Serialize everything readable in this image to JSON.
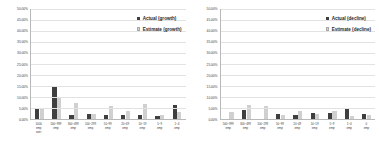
{
  "chart_data": [
    {
      "type": "bar",
      "title": "",
      "xlabel": "",
      "ylabel": "",
      "ylim": [
        0,
        50
      ],
      "grid": true,
      "legend_position": "top-right",
      "tick_labels": [
        "0.00%",
        "5.00%",
        "10.00%",
        "15.00%",
        "20.00%",
        "25.00%",
        "30.00%",
        "35.00%",
        "40.00%",
        "45.00%",
        "50.00%"
      ],
      "categories": [
        "1000\nemp\nover",
        "500~999\nemp",
        "300~499\nemp",
        "100~299\nemp",
        "50~99\nemp",
        "20~49\nemp",
        "10~19\nemp",
        "5~9\nemp",
        "1~4\nemp"
      ],
      "series": [
        {
          "name": "Actual (growth)",
          "values": [
            4.6,
            15.0,
            2.0,
            2.3,
            1.8,
            2.0,
            1.8,
            1.5,
            6.2
          ]
        },
        {
          "name": "Estimate (growth)",
          "values": [
            4.5,
            9.5,
            7.4,
            2.4,
            5.8,
            3.8,
            6.6,
            1.9,
            3.1
          ]
        }
      ]
    },
    {
      "type": "bar",
      "title": "",
      "xlabel": "",
      "ylabel": "",
      "ylim": [
        0,
        50
      ],
      "grid": true,
      "legend_position": "top-right",
      "tick_labels": [
        "0.00%",
        "5.00%",
        "10.00%",
        "15.00%",
        "20.00%",
        "25.00%",
        "30.00%",
        "35.00%",
        "40.00%",
        "45.00%",
        "50.00%"
      ],
      "categories": [
        "500~999\nemp",
        "300~499\nemp",
        "100~299\nemp",
        "50~99\nemp",
        "20~49\nemp",
        "10~19\nemp",
        "5~9\nemp",
        "1~4\nemp",
        "0\nemp"
      ],
      "series": [
        {
          "name": "Actual (decline)",
          "values": [
            0.0,
            4.3,
            0.0,
            2.2,
            2.0,
            2.6,
            2.8,
            4.6,
            2.4
          ]
        },
        {
          "name": "Estimate (decline)",
          "values": [
            3.3,
            6.2,
            5.8,
            1.6,
            3.5,
            2.5,
            3.5,
            1.3,
            1.9
          ]
        }
      ]
    }
  ],
  "panels": [
    {
      "legend": [
        {
          "label": "Actual (growth)",
          "swatch": "actual",
          "color": "#3f3f3f"
        },
        {
          "label": "Estimate (growth)",
          "swatch": "estimate",
          "color": "#d0d0d0"
        }
      ]
    },
    {
      "legend": [
        {
          "label": "Actual (decline)",
          "swatch": "actual",
          "color": "#3f3f3f"
        },
        {
          "label": "Estimate (decline)",
          "swatch": "estimate",
          "color": "#d0d0d0"
        }
      ]
    }
  ],
  "colors": {
    "actual": "#3f3f3f",
    "estimate": "#d0d0d0",
    "gridline": "#e2e2e2",
    "axis": "#b9b9b9",
    "text": "#3d3d3d",
    "background": "#ffffff"
  }
}
